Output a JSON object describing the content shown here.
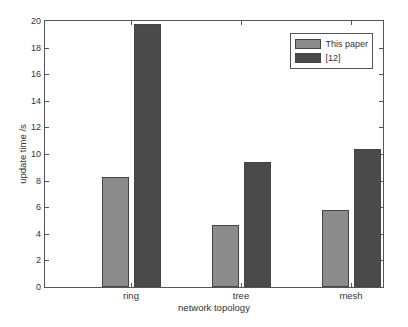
{
  "chart_data": {
    "type": "bar",
    "title": "",
    "xlabel": "network topology",
    "ylabel": "update time /s",
    "categories": [
      "ring",
      "tree",
      "mesh"
    ],
    "series": [
      {
        "name": "This paper",
        "values": [
          8.3,
          4.7,
          5.8
        ],
        "color": "#8c8c8c"
      },
      {
        "name": "[12]",
        "values": [
          19.8,
          9.4,
          10.4
        ],
        "color": "#4a4a4a"
      }
    ],
    "ylim": [
      0,
      20
    ],
    "yticks": [
      "0",
      "2",
      "4",
      "6",
      "8",
      "10",
      "12",
      "14",
      "16",
      "18",
      "20"
    ],
    "grid": false,
    "legend_position": "upper right"
  }
}
